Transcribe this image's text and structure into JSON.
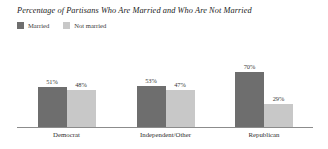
{
  "chart_data": {
    "type": "bar",
    "title": "Percentage of Partisans Who Are Married and Who Are Not Married",
    "xlabel": "",
    "ylabel": "",
    "ylim": [
      0,
      100
    ],
    "grid": false,
    "legend_position": "top-left",
    "categories": [
      "Democrat",
      "Independent/Other",
      "Republican"
    ],
    "series": [
      {
        "name": "Married",
        "color": "#6e6e6e",
        "values": [
          51,
          53,
          70
        ],
        "value_labels": [
          "51%",
          "48%",
          "70%"
        ]
      },
      {
        "name": "Not married",
        "color": "#c8c8c8",
        "values": [
          48,
          47,
          29
        ],
        "value_labels": [
          "48%",
          "47%",
          "29%"
        ]
      }
    ],
    "groups": [
      {
        "category": "Democrat",
        "bars": [
          {
            "series": "Married",
            "value": 51,
            "label": "51%"
          },
          {
            "series": "Not married",
            "value": 48,
            "label": "48%"
          }
        ]
      },
      {
        "category": "Independent/Other",
        "bars": [
          {
            "series": "Married",
            "value": 53,
            "label": "53%"
          },
          {
            "series": "Not married",
            "value": 47,
            "label": "47%"
          }
        ]
      },
      {
        "category": "Republican",
        "bars": [
          {
            "series": "Married",
            "value": 70,
            "label": "70%"
          },
          {
            "series": "Not married",
            "value": 29,
            "label": "29%"
          }
        ]
      }
    ]
  },
  "legend": {
    "entries": [
      {
        "label": "Married",
        "color": "#6e6e6e"
      },
      {
        "label": "Not married",
        "color": "#c8c8c8"
      }
    ]
  },
  "colors": {
    "married": "#6e6e6e",
    "not_married": "#c8c8c8",
    "axis": "#8c8c8c",
    "background": "#ffffff",
    "text": "#2b2b2b"
  }
}
